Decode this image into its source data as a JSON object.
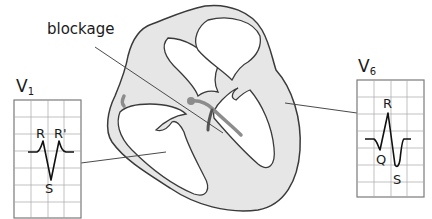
{
  "diagram": {
    "callout": {
      "label": "blockage"
    },
    "leads": [
      {
        "id": "V1",
        "name": "V",
        "subscript": "1",
        "waves": {
          "r": "R",
          "r_prime": "R'",
          "s": "S"
        }
      },
      {
        "id": "V6",
        "name": "V",
        "subscript": "6",
        "waves": {
          "r": "R",
          "q": "Q",
          "s": "S"
        }
      }
    ],
    "colors": {
      "outline": "#3a3a3a",
      "wall_fill": "#e6e6e6",
      "grid": "#9a9a9a",
      "conduction": "#8c8c8c",
      "trace": "#111111"
    }
  }
}
